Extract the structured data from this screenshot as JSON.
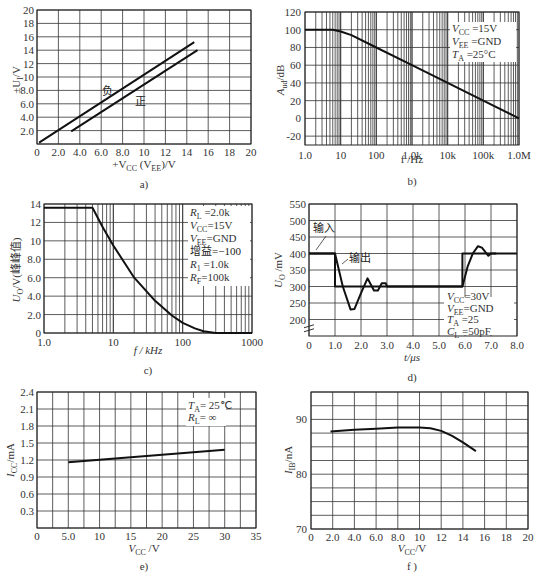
{
  "chart_data": [
    {
      "id": "a",
      "type": "line",
      "caption": "a)",
      "xlabel": "+V_CC (V_EE)/V",
      "ylabel": "±U_I/V",
      "xlim": [
        0,
        20
      ],
      "ylim": [
        0,
        20
      ],
      "x_ticks": [
        "0",
        "2.0",
        "4.0",
        "6.0",
        "8.0",
        "10",
        "12",
        "14",
        "16",
        "18",
        "20"
      ],
      "y_ticks": [
        "2.0",
        "4.0",
        "6.0",
        "8.0",
        "10",
        "12",
        "14",
        "16",
        "18",
        "20"
      ],
      "grid": true,
      "series": [
        {
          "name": "负",
          "x": [
            0.2,
            14.7
          ],
          "y": [
            0.2,
            15.2
          ]
        },
        {
          "name": "正",
          "x": [
            3.2,
            15.0
          ],
          "y": [
            1.9,
            14.0
          ]
        }
      ]
    },
    {
      "id": "b",
      "type": "line",
      "caption": "b)",
      "xlabel": "f /Hz",
      "ylabel": "A_ud/dB",
      "xscale": "log",
      "xlim": [
        1,
        1000000
      ],
      "ylim": [
        -30,
        120
      ],
      "x_ticks": [
        "1.0",
        "10",
        "100",
        "1.0k",
        "10k",
        "100k",
        "1.0M"
      ],
      "y_ticks": [
        "120",
        "100",
        "80",
        "60",
        "40",
        "20",
        "0",
        "-20"
      ],
      "grid": true,
      "annotations": [
        "V_CC=15V",
        "V_EE=GND",
        "T_A=25°C"
      ],
      "series": [
        {
          "name": "A_ud",
          "x": [
            1,
            6,
            10,
            20,
            100,
            1000,
            10000,
            100000,
            1000000
          ],
          "y": [
            100,
            100,
            98,
            94,
            80,
            60,
            40,
            20,
            0
          ]
        }
      ]
    },
    {
      "id": "c",
      "type": "line",
      "caption": "c)",
      "xlabel": "f / kHz",
      "ylabel": "U_O/V(峰峰值)",
      "xscale": "log",
      "xlim": [
        1,
        1000
      ],
      "ylim": [
        0,
        14
      ],
      "x_ticks": [
        "1.0",
        "10",
        "100",
        "1000"
      ],
      "y_ticks": [
        "14",
        "12",
        "10",
        "8.0",
        "6.0",
        "4.0",
        "2.0",
        "0"
      ],
      "grid": true,
      "annotations": [
        "R_L=2.0k",
        "V_CC=15V",
        "V_EE=GND",
        "增益=-100",
        "R_1=1.0k",
        "R_F=100k"
      ],
      "series": [
        {
          "name": "U_O",
          "x": [
            1,
            5,
            7,
            10,
            20,
            40,
            70,
            100,
            150,
            200,
            300,
            1000
          ],
          "y": [
            13.6,
            13.6,
            11.5,
            9.5,
            6.0,
            3.5,
            1.9,
            1.1,
            0.5,
            0.2,
            0,
            0
          ]
        }
      ]
    },
    {
      "id": "d",
      "type": "line",
      "caption": "d)",
      "xlabel": "t/μs",
      "ylabel": "U_O/mV",
      "xlim": [
        0,
        8
      ],
      "ylim": [
        150,
        550
      ],
      "x_ticks": [
        "0",
        "1.0",
        "2.0",
        "3.0",
        "4.0",
        "5.0",
        "6.0",
        "7.0",
        "8.0"
      ],
      "y_ticks": [
        "550",
        "500",
        "450",
        "400",
        "350",
        "300",
        "250",
        "200"
      ],
      "grid": true,
      "annotations": [
        "V_CC=30V",
        "V_EE=GND",
        "T_A=25",
        "C_L=50pF"
      ],
      "labels": {
        "input": "输入",
        "output": "输出"
      },
      "series": [
        {
          "name": "输入",
          "x": [
            0,
            1.0,
            1.0,
            5.9,
            5.9,
            8.0
          ],
          "y": [
            400,
            400,
            300,
            300,
            400,
            400
          ]
        },
        {
          "name": "输出",
          "x": [
            0,
            1.0,
            1.3,
            1.6,
            1.75,
            2.0,
            2.25,
            2.5,
            2.65,
            2.8,
            2.95,
            3.0,
            5.9,
            6.1,
            6.3,
            6.5,
            6.65,
            6.9,
            7.0,
            7.2
          ],
          "y": [
            400,
            400,
            300,
            230,
            232,
            280,
            325,
            288,
            288,
            310,
            310,
            300,
            300,
            360,
            400,
            422,
            418,
            393,
            400,
            400
          ]
        }
      ]
    },
    {
      "id": "e",
      "type": "line",
      "caption": "e)",
      "xlabel": "V_CC/V",
      "ylabel": "I_CC/mA",
      "xlim": [
        0,
        35
      ],
      "ylim": [
        0,
        2.4
      ],
      "x_ticks": [
        "0",
        "5.0",
        "10",
        "15",
        "20",
        "25",
        "30",
        "35"
      ],
      "y_ticks": [
        "2.4",
        "2.1",
        "1.8",
        "1.5",
        "1.2",
        "0.9",
        "0.6",
        "0.3"
      ],
      "grid": true,
      "annotations": [
        "T_A=25℃",
        "R_L=∞"
      ],
      "series": [
        {
          "name": "I_CC",
          "x": [
            5,
            30
          ],
          "y": [
            1.16,
            1.38
          ]
        }
      ]
    },
    {
      "id": "f",
      "type": "line",
      "caption": "f)",
      "xlabel": "V_CC/V",
      "ylabel": "I_IB/nA",
      "xlim": [
        0,
        20
      ],
      "ylim": [
        70,
        95
      ],
      "x_ticks": [
        "0",
        "2.0",
        "4.0",
        "6.0",
        "8.0",
        "10",
        "12",
        "14",
        "16",
        "18",
        "20"
      ],
      "y_ticks": [
        "90",
        "80",
        "70"
      ],
      "grid": true,
      "series": [
        {
          "name": "I_IB",
          "x": [
            1.8,
            4,
            6,
            8,
            10,
            11,
            12,
            13,
            14,
            15.2
          ],
          "y": [
            87.8,
            88.1,
            88.3,
            88.5,
            88.5,
            88.4,
            87.9,
            87.0,
            85.8,
            84.2
          ]
        }
      ]
    }
  ],
  "labels": {
    "a": {
      "caption": "a)",
      "ylabel": "±U",
      "ylabel_sub": "I",
      "ylabel_unit": "/V",
      "xlabel": "+V",
      "xlabel_sub": "CC",
      "xlabel_mid": " (V",
      "xlabel_sub2": "EE",
      "xlabel_end": ")/V",
      "neg": "负",
      "pos": "正"
    },
    "b": {
      "caption": "b)",
      "ylabel": "A",
      "ylabel_sub": "ud",
      "ylabel_unit": "/dB",
      "xlabel": "f /Hz",
      "ann1": "V",
      "ann1s": "CC",
      "ann1v": " =15V",
      "ann2": "V",
      "ann2s": "EE",
      "ann2v": " =GND",
      "ann3": "T",
      "ann3s": "A",
      "ann3v": " =25°C"
    },
    "c": {
      "caption": "c)",
      "ylabel": "U",
      "ylabel_sub": "O",
      "ylabel_unit": "/V(峰峰值)",
      "xlabel": "f / kHz",
      "a1": "R",
      "a1s": "L",
      "a1v": " =2.0k",
      "a2": "V",
      "a2s": "CC",
      "a2v": "=15V",
      "a3": "V",
      "a3s": "EE",
      "a3v": "=GND",
      "a4": "增益=−100",
      "a5": "R",
      "a5s": "1",
      "a5v": " =1.0k",
      "a6": "R",
      "a6s": "F",
      "a6v": "=100k"
    },
    "d": {
      "caption": "d)",
      "ylabel": "U",
      "ylabel_sub": "O",
      "ylabel_unit": " /mV",
      "xlabel": "t/μs",
      "input": "输入",
      "output": "输出",
      "a1": "V",
      "a1s": "CC",
      "a1v": "=30V",
      "a2": "V",
      "a2s": "EE",
      "a2v": "=GND",
      "a3": "T",
      "a3s": "A",
      "a3v": " =25",
      "a4": "C",
      "a4s": "L",
      "a4v": " =50pF"
    },
    "e": {
      "caption": "e)",
      "ylabel": "I",
      "ylabel_sub": "CC",
      "ylabel_unit": "/mA",
      "xlabel": "V",
      "xlabel_sub": "CC",
      "xlabel_unit": " /V",
      "a1": "T",
      "a1s": "A",
      "a1v": "= 25℃",
      "a2": "R",
      "a2s": "L",
      "a2v": "= ∞"
    },
    "f": {
      "caption": "f )",
      "ylabel": "I",
      "ylabel_sub": "IB",
      "ylabel_unit": "/nA",
      "xlabel": "V",
      "xlabel_sub": "CC",
      "xlabel_unit": "/V"
    }
  }
}
